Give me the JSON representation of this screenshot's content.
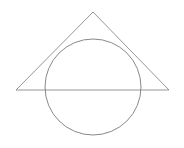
{
  "diagram": {
    "background": "#ffffff",
    "triangle": {
      "points": [
        [
          93,
          12
        ],
        [
          16,
          90
        ],
        [
          169,
          90
        ]
      ],
      "stroke": "#8a8a8a",
      "stroke_width": 0.9
    },
    "circle": {
      "cx": 93,
      "cy": 87,
      "r": 48,
      "stroke": "#7a7a7a",
      "stroke_width": 0.9
    }
  }
}
